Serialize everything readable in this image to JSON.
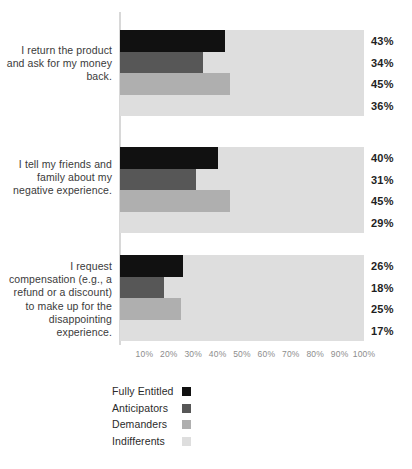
{
  "chart_data": {
    "type": "bar",
    "orientation": "horizontal",
    "title": "",
    "subtitle": "",
    "xlabel": "",
    "ylabel": "",
    "xlim": [
      0,
      100
    ],
    "grid": false,
    "legend_position": "bottom-left",
    "value_suffix": "%",
    "categories": [
      "I return the product and ask for my money back.",
      "I tell my friends and family about my negative experience.",
      "I request compensation (e.g., a refund or a discount) to make up for the disappointing experience."
    ],
    "series": [
      {
        "name": "Fully Entitled",
        "color": "#111111",
        "values": [
          43,
          40,
          26
        ]
      },
      {
        "name": "Anticipators",
        "color": "#575757",
        "values": [
          34,
          31,
          18
        ]
      },
      {
        "name": "Demanders",
        "color": "#afafaf",
        "values": [
          45,
          45,
          25
        ]
      },
      {
        "name": "Indifferents",
        "color": "#dedede",
        "values": [
          36,
          29,
          17
        ]
      }
    ],
    "xticks": [
      {
        "value": 10,
        "label": "10%"
      },
      {
        "value": 20,
        "label": "20%"
      },
      {
        "value": 30,
        "label": "30%"
      },
      {
        "value": 40,
        "label": "40%"
      },
      {
        "value": 50,
        "label": "50%"
      },
      {
        "value": 60,
        "label": "60%"
      },
      {
        "value": 70,
        "label": "70%"
      },
      {
        "value": 80,
        "label": "80%"
      },
      {
        "value": 90,
        "label": "90%"
      },
      {
        "value": 100,
        "label": "100%"
      }
    ],
    "value_labels": [
      [
        "43%",
        "34%",
        "45%",
        "36%"
      ],
      [
        "40%",
        "31%",
        "45%",
        "29%"
      ],
      [
        "26%",
        "18%",
        "25%",
        "17%"
      ]
    ],
    "band_color": "#dedede",
    "axis_line_color": "#d8d8d8",
    "tick_label_color": "#8d8d8d"
  }
}
